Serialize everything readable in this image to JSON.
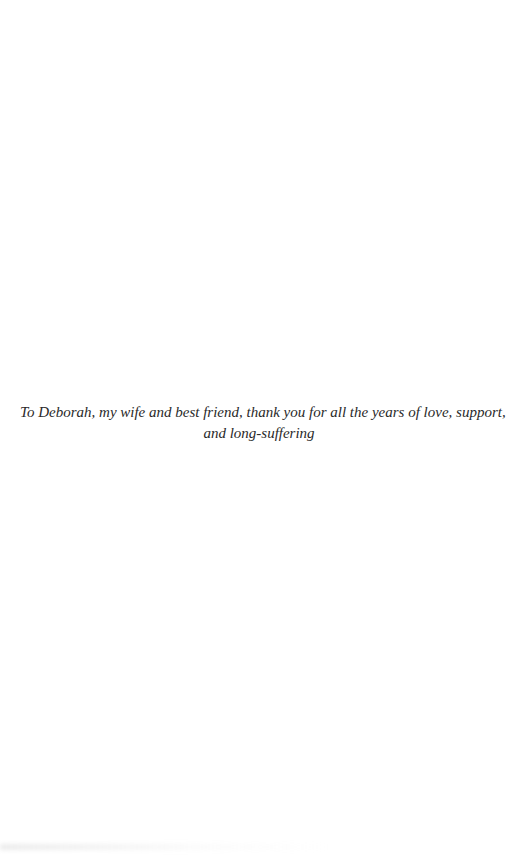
{
  "page": {
    "type": "dedication",
    "background": "#ffffff",
    "text_color": "#2a2a2a"
  },
  "dedication": {
    "lines": [
      "To Deborah, my wife and best friend, thank you for all the years of love, support,",
      "and long-suffering"
    ]
  }
}
